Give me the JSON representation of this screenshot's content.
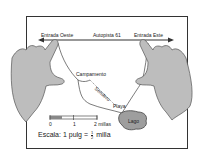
{
  "diagram": {
    "labels": {
      "west_entrance": "Entrada Oeste",
      "highway": "Autopista 61",
      "east_entrance": "Entrada Este",
      "camp": "Campamento",
      "trail": "Sendero",
      "beach": "Playa",
      "lake": "Lago"
    },
    "scale_bar": {
      "ticks": [
        "0",
        "1",
        "2 millas"
      ]
    },
    "scale": {
      "prefix": "Escala: 1 pulg =",
      "fraction_num": "1",
      "fraction_den": "2",
      "unit": "milla"
    },
    "colors": {
      "hand_fill": "#bdbdbd",
      "hand_stroke": "#555555",
      "lake_fill": "#9e9e9e",
      "line": "#333333"
    }
  }
}
